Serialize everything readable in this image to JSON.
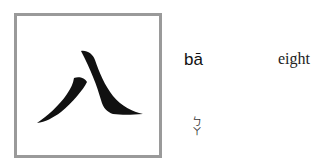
{
  "character": {
    "hanzi": "八",
    "pinyin": "bā",
    "meaning": "eight",
    "zhuyin": [
      "ㄅ",
      "ㄚ"
    ]
  },
  "colors": {
    "frame": "#9a9a9a",
    "ink": "#111111"
  }
}
